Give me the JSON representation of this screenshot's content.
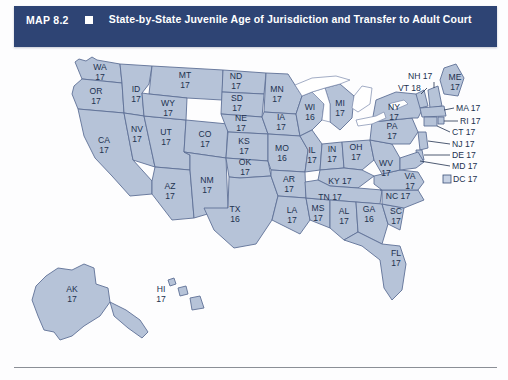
{
  "header": {
    "map_number": "MAP 8.2",
    "bullet_icon": "filled-square-icon",
    "title": "State-by-State Juvenile Age of Jurisdiction and Transfer to Adult Court",
    "background_color": "#2e4474",
    "text_color": "#ffffff"
  },
  "map": {
    "fill_color": "#b6c3d8",
    "border_color": "#5f7096",
    "label_color": "#21314f",
    "lake_color": "#ffffff"
  },
  "states": {
    "WA": {
      "abbr": "WA",
      "age": "17"
    },
    "OR": {
      "abbr": "OR",
      "age": "17"
    },
    "CA": {
      "abbr": "CA",
      "age": "17"
    },
    "ID": {
      "abbr": "ID",
      "age": "17"
    },
    "NV": {
      "abbr": "NV",
      "age": "17"
    },
    "UT": {
      "abbr": "UT",
      "age": "17"
    },
    "AZ": {
      "abbr": "AZ",
      "age": "17"
    },
    "MT": {
      "abbr": "MT",
      "age": "17"
    },
    "WY": {
      "abbr": "WY",
      "age": "17"
    },
    "CO": {
      "abbr": "CO",
      "age": "17"
    },
    "NM": {
      "abbr": "NM",
      "age": "17"
    },
    "ND": {
      "abbr": "ND",
      "age": "17"
    },
    "SD": {
      "abbr": "SD",
      "age": "17"
    },
    "NE": {
      "abbr": "NE",
      "age": "17"
    },
    "KS": {
      "abbr": "KS",
      "age": "17"
    },
    "OK": {
      "abbr": "OK",
      "age": "17"
    },
    "TX": {
      "abbr": "TX",
      "age": "16"
    },
    "MN": {
      "abbr": "MN",
      "age": "17"
    },
    "IA": {
      "abbr": "IA",
      "age": "17"
    },
    "MO": {
      "abbr": "MO",
      "age": "16"
    },
    "AR": {
      "abbr": "AR",
      "age": "17"
    },
    "LA": {
      "abbr": "LA",
      "age": "17"
    },
    "WI": {
      "abbr": "WI",
      "age": "16"
    },
    "IL": {
      "abbr": "IL",
      "age": "17"
    },
    "MS": {
      "abbr": "MS",
      "age": "17"
    },
    "MI": {
      "abbr": "MI",
      "age": "17"
    },
    "IN": {
      "abbr": "IN",
      "age": "17"
    },
    "OH": {
      "abbr": "OH",
      "age": "17"
    },
    "KY": {
      "abbr": "KY 17",
      "age": ""
    },
    "TN": {
      "abbr": "TN 17",
      "age": ""
    },
    "AL": {
      "abbr": "AL",
      "age": "17"
    },
    "GA": {
      "abbr": "GA",
      "age": "16"
    },
    "FL": {
      "abbr": "FL",
      "age": "17"
    },
    "SC": {
      "abbr": "SC",
      "age": "17"
    },
    "NC": {
      "abbr": "NC 17",
      "age": ""
    },
    "VA": {
      "abbr": "VA",
      "age": "17"
    },
    "WV": {
      "abbr": "WV",
      "age": "17"
    },
    "PA": {
      "abbr": "PA",
      "age": "17"
    },
    "NY": {
      "abbr": "NY",
      "age": "17"
    },
    "ME": {
      "abbr": "ME",
      "age": "17"
    },
    "AK": {
      "abbr": "AK",
      "age": "17"
    },
    "HI": {
      "abbr": "HI",
      "age": "17"
    }
  },
  "callouts": [
    {
      "id": "NH",
      "label": "NH 17"
    },
    {
      "id": "VT",
      "label": "VT 18"
    },
    {
      "id": "MA",
      "label": "MA 17"
    },
    {
      "id": "RI",
      "label": "RI 17"
    },
    {
      "id": "CT",
      "label": "CT 17"
    },
    {
      "id": "NJ",
      "label": "NJ 17"
    },
    {
      "id": "DE",
      "label": "DE 17"
    },
    {
      "id": "MD",
      "label": "MD 17"
    },
    {
      "id": "DC",
      "label": "DC 17"
    }
  ]
}
